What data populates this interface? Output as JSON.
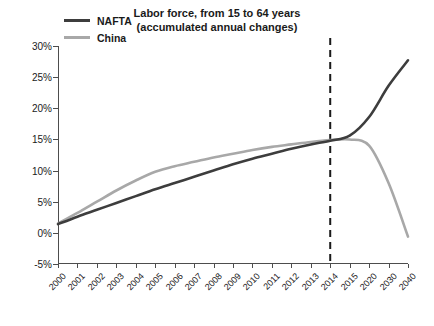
{
  "chart_data": {
    "type": "line",
    "title": "Labor force, from 15 to 64 years",
    "subtitle": "(accumulated annual changes)",
    "xlabel": "",
    "ylabel": "",
    "ylim": [
      -5,
      30
    ],
    "yticks": [
      "-5%",
      "0%",
      "5%",
      "10%",
      "15%",
      "20%",
      "25%",
      "30%"
    ],
    "ytick_values": [
      -5,
      0,
      5,
      10,
      15,
      20,
      25,
      30
    ],
    "categories": [
      "2000",
      "2001",
      "2002",
      "2003",
      "2004",
      "2005",
      "2006",
      "2007",
      "2008",
      "2009",
      "2010",
      "2011",
      "2012",
      "2013",
      "2014",
      "2015",
      "2020",
      "2030",
      "2040"
    ],
    "grid": false,
    "legend_position": "top-left",
    "annotations": [
      {
        "type": "vline",
        "at": "2014",
        "style": "dashed",
        "color": "#1a1a1a"
      }
    ],
    "series": [
      {
        "name": "NAFTA",
        "color": "#3d3d3d",
        "values": [
          1.4,
          2.6,
          3.7,
          4.8,
          5.9,
          7.0,
          8.0,
          9.0,
          10.0,
          11.0,
          11.9,
          12.7,
          13.5,
          14.2,
          14.8,
          15.6,
          18.6,
          23.6,
          27.7
        ]
      },
      {
        "name": "China",
        "color": "#a8a8a8",
        "values": [
          1.5,
          3.2,
          5.0,
          6.8,
          8.4,
          9.8,
          10.7,
          11.4,
          12.1,
          12.7,
          13.3,
          13.8,
          14.2,
          14.6,
          14.9,
          15.0,
          14.0,
          8.0,
          -0.6
        ]
      }
    ]
  }
}
